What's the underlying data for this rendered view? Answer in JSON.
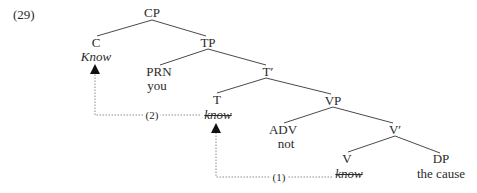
{
  "example_number": "(29)",
  "tree": {
    "nodes": {
      "CP": {
        "label": "CP"
      },
      "C": {
        "label": "C",
        "word": "Know"
      },
      "TP": {
        "label": "TP"
      },
      "PRN": {
        "label": "PRN",
        "word": "you"
      },
      "Tbar": {
        "label": "T′"
      },
      "T": {
        "label": "T",
        "word": "know",
        "word_struck": true
      },
      "VP": {
        "label": "VP"
      },
      "ADV": {
        "label": "ADV",
        "word": "not"
      },
      "Vbar": {
        "label": "V′"
      },
      "V": {
        "label": "V",
        "word": "know",
        "word_struck": true
      },
      "DP": {
        "label": "DP",
        "word": "the cause"
      }
    },
    "edges": [
      [
        "CP",
        "C"
      ],
      [
        "CP",
        "TP"
      ],
      [
        "TP",
        "PRN"
      ],
      [
        "TP",
        "Tbar"
      ],
      [
        "Tbar",
        "T"
      ],
      [
        "Tbar",
        "VP"
      ],
      [
        "VP",
        "ADV"
      ],
      [
        "VP",
        "Vbar"
      ],
      [
        "Vbar",
        "V"
      ],
      [
        "Vbar",
        "DP"
      ]
    ]
  },
  "movements": [
    {
      "step": "(1)",
      "from": "V",
      "to": "T",
      "description": "V-to-T movement"
    },
    {
      "step": "(2)",
      "from": "T",
      "to": "C",
      "description": "T-to-C movement"
    }
  ],
  "colors": {
    "text": "#2a2a2a",
    "lines": "#4a4a4a",
    "dotted": "#8a8a8a",
    "arrowhead": "#111111"
  }
}
